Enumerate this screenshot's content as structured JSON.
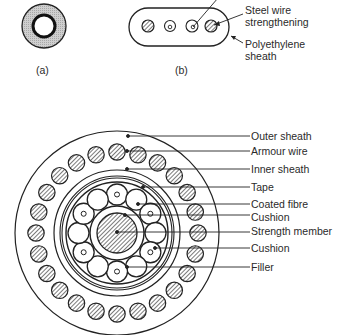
{
  "figure_a": {
    "caption": "(a)"
  },
  "figure_b": {
    "caption": "(b)",
    "labels": [
      {
        "id": "steel",
        "line1": "Steel wire",
        "line2": "strengthening"
      },
      {
        "id": "sheath",
        "line1": "Polyethylene",
        "line2": "sheath"
      }
    ]
  },
  "figure_c": {
    "labels": [
      "Outer sheath",
      "Armour wire",
      "Inner sheath",
      "Tape",
      "Coated fibre",
      "Cushion",
      "Strength member",
      "Cushion",
      "Filler"
    ]
  },
  "colors": {
    "line": "#222222",
    "hatch": "#333333",
    "stipple": "#bdbdbd"
  }
}
